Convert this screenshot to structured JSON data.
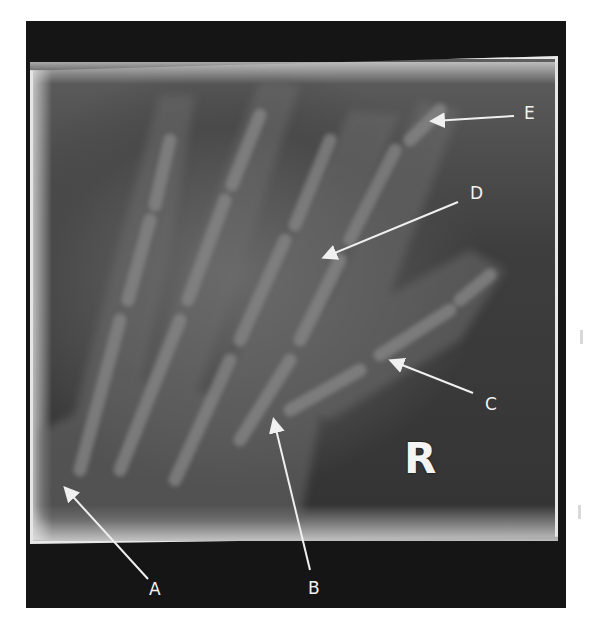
{
  "figure": {
    "type": "hand radiograph",
    "side_marker": "R",
    "labels": [
      {
        "id": "A",
        "text": "A"
      },
      {
        "id": "B",
        "text": "B"
      },
      {
        "id": "C",
        "text": "C"
      },
      {
        "id": "D",
        "text": "D"
      },
      {
        "id": "E",
        "text": "E"
      }
    ],
    "colors": {
      "background": "#ffffff",
      "frame": "#151515",
      "plate": "#404040",
      "plate_edge": "#e0e0e0",
      "arrow": "#f0f0f0",
      "label_on_image": "#f2f2f2",
      "label_on_frame": "#f2f2f2"
    }
  }
}
